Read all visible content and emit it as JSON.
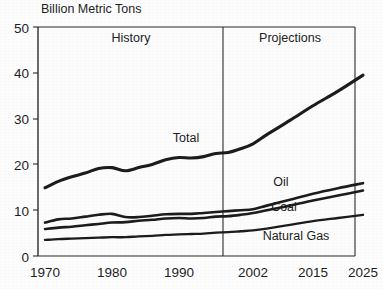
{
  "chart_data": {
    "type": "line",
    "title": "",
    "ylabel": "Billion Metric Tons",
    "xlabel": "",
    "ylim": [
      0,
      50
    ],
    "xlim": [
      1970,
      2025
    ],
    "grid": false,
    "legend": "inline-annotations",
    "yticks": [
      "0",
      "10",
      "20",
      "30",
      "40",
      "50"
    ],
    "ytick_values": [
      0,
      10,
      20,
      30,
      40,
      50
    ],
    "xticks": [
      "1970",
      "1980",
      "1990",
      "2002",
      "2015",
      "2025"
    ],
    "xtick_values": [
      1970,
      1980,
      1990,
      2002,
      2015,
      2025
    ],
    "annotations": [
      {
        "text": "History",
        "x": 1985,
        "y": 46
      },
      {
        "text": "Projections",
        "x": 2013,
        "y": 46
      },
      {
        "text": "Total",
        "x": 1992,
        "y": 25.5
      },
      {
        "text": "Oil",
        "x": 2010,
        "y": 16.5
      },
      {
        "text": "Coal",
        "x": 2011,
        "y": 11.4
      },
      {
        "text": "Natural Gas",
        "x": 2013,
        "y": 5.2
      }
    ],
    "divider": {
      "x": 2002,
      "label_left": "History",
      "label_right": "Projections"
    },
    "x": [
      1970,
      1972,
      1974,
      1976,
      1978,
      1980,
      1982,
      1984,
      1986,
      1988,
      1990,
      1992,
      1994,
      1996,
      1998,
      2000,
      2002,
      2005,
      2010,
      2015,
      2020,
      2025
    ],
    "series": [
      {
        "name": "Total",
        "values": [
          14.9,
          16.3,
          17.3,
          18.1,
          19.1,
          19.3,
          18.6,
          19.3,
          20.0,
          21.0,
          21.5,
          21.4,
          21.7,
          22.4,
          22.6,
          23.4,
          24.5,
          26.5,
          29.6,
          32.8,
          36.0,
          39.5
        ]
      },
      {
        "name": "Oil",
        "values": [
          7.3,
          8.0,
          8.2,
          8.6,
          9.0,
          9.2,
          8.5,
          8.5,
          8.8,
          9.1,
          9.2,
          9.2,
          9.4,
          9.6,
          9.8,
          10.0,
          10.2,
          11.0,
          12.3,
          13.6,
          14.8,
          15.9
        ]
      },
      {
        "name": "Coal",
        "values": [
          5.9,
          6.2,
          6.4,
          6.7,
          7.0,
          7.3,
          7.4,
          7.7,
          7.9,
          8.2,
          8.3,
          8.2,
          8.3,
          8.6,
          8.7,
          9.0,
          9.4,
          10.0,
          11.0,
          12.1,
          13.2,
          14.3
        ]
      },
      {
        "name": "Natural Gas",
        "values": [
          3.5,
          3.7,
          3.8,
          3.9,
          4.0,
          4.1,
          4.1,
          4.3,
          4.4,
          4.6,
          4.7,
          4.8,
          4.9,
          5.1,
          5.2,
          5.4,
          5.6,
          6.0,
          6.8,
          7.6,
          8.3,
          9.0
        ]
      }
    ],
    "colors": {
      "line": "#1c1c1c",
      "axis": "#2b2b2b",
      "background": "#fdfdfd"
    }
  }
}
